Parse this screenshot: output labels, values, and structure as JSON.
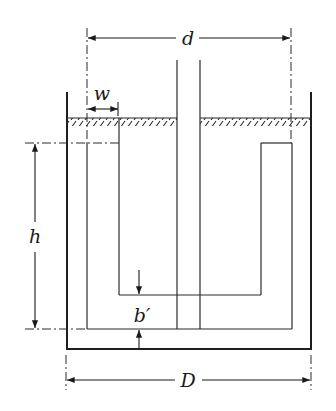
{
  "diagram": {
    "type": "tank-cross-section",
    "colors": {
      "line": "#2a2a2a",
      "background": "#ffffff"
    },
    "labels": {
      "d": "d",
      "w": "w",
      "h": "h",
      "b_prime": "b′",
      "D": "D"
    },
    "dimensions": [
      {
        "name": "d",
        "description": "distance between dash-dot centerlines"
      },
      {
        "name": "w",
        "description": "channel width"
      },
      {
        "name": "h",
        "description": "submerged height"
      },
      {
        "name": "b′",
        "description": "bottom clearance"
      },
      {
        "name": "D",
        "description": "tank outer width"
      }
    ]
  }
}
